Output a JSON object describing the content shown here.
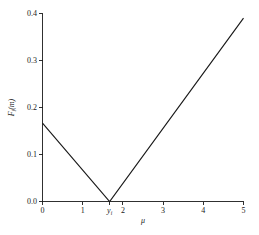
{
  "chart_data": {
    "type": "line",
    "title": "",
    "subtitle": "",
    "xlabel": "μ",
    "ylabel": "F",
    "ylabel_sub": "i",
    "ylabel_tail": "(m)",
    "xlim": [
      0,
      5
    ],
    "ylim": [
      0,
      0.4
    ],
    "grid": false,
    "legend": null,
    "legend_position": "none",
    "x_ticks": [
      {
        "value": 0,
        "label": "0",
        "italic": false,
        "sub": ""
      },
      {
        "value": 1,
        "label": "1",
        "italic": false,
        "sub": ""
      },
      {
        "value": 1.67,
        "label": "y",
        "italic": true,
        "sub": "i"
      },
      {
        "value": 2,
        "label": "2",
        "italic": false,
        "sub": ""
      },
      {
        "value": 3,
        "label": "3",
        "italic": false,
        "sub": ""
      },
      {
        "value": 4,
        "label": "4",
        "italic": false,
        "sub": ""
      },
      {
        "value": 5,
        "label": "5",
        "italic": false,
        "sub": ""
      }
    ],
    "y_ticks": [
      {
        "value": 0.0,
        "label": "0.0"
      },
      {
        "value": 0.1,
        "label": "0.1"
      },
      {
        "value": 0.2,
        "label": "0.2"
      },
      {
        "value": 0.3,
        "label": "0.3"
      },
      {
        "value": 0.4,
        "label": "0.4"
      }
    ],
    "series": [
      {
        "name": "F_i(m)",
        "color": "#1a1a1a",
        "x": [
          0,
          1.67,
          5
        ],
        "values": [
          0.167,
          0.0,
          0.39
        ]
      }
    ],
    "annotations": [
      {
        "text": "y_i",
        "x": 1.67,
        "y": 0.0,
        "note": "minimum of the V-shaped function at the tick labelled y_i"
      }
    ]
  }
}
